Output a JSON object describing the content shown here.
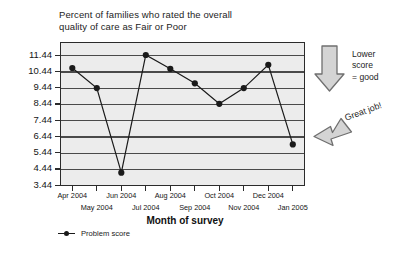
{
  "chart_data": {
    "type": "line",
    "title": "Percent of families who rated the overall quality of care as Fair or Poor",
    "title_line1": "Percent of families who rated the overall",
    "title_line2": "quality of care as Fair or Poor",
    "xlabel": "Month of survey",
    "ylabel": "",
    "categories": [
      "Apr 2004",
      "May 2004",
      "Jun 2004",
      "Jul 2004",
      "Aug 2004",
      "Sep 2004",
      "Oct 2004",
      "Nov 2004",
      "Dec 2004",
      "Jan 2005"
    ],
    "values": [
      10.64,
      9.4,
      4.2,
      11.44,
      10.59,
      9.7,
      8.44,
      9.4,
      10.84,
      5.94
    ],
    "series": [
      {
        "name": "Problem score",
        "values": [
          10.64,
          9.4,
          4.2,
          11.44,
          10.59,
          9.7,
          8.44,
          9.4,
          10.84,
          5.94
        ]
      }
    ],
    "ylim": [
      3.44,
      11.44
    ],
    "ytick_labels": [
      "11.44",
      "10.44",
      "9.44",
      "8.44",
      "7.44",
      "6.44",
      "5.44",
      "4.44",
      "3.44"
    ],
    "ytick_values": [
      11.44,
      10.44,
      9.44,
      8.44,
      7.44,
      6.44,
      5.44,
      4.44,
      3.44
    ],
    "grid": true,
    "legend_position": "below-left",
    "legend": [
      "Problem score"
    ],
    "annotations": [
      {
        "name": "lower-score-good",
        "text_lines": [
          "Lower",
          "score",
          "= good"
        ],
        "shape": "down-arrow"
      },
      {
        "name": "great-job",
        "text": "Great job!",
        "shape": "left-pointing-arrow",
        "points_to": "Jan 2005"
      }
    ],
    "colors": {
      "plot_background": "#ececec",
      "line": "#1a1a1a",
      "marker": "#1a1a1a",
      "gridline": "#4a4a4a",
      "frame": "#2b2b2b",
      "arrow_fill": "#d4d4d4",
      "arrow_stroke": "#6f6f6f"
    }
  },
  "legend": {
    "series_label": "Problem score"
  },
  "annotations": {
    "lower": "Lower",
    "score": "score",
    "good": "= good",
    "great_job": "Great job!"
  }
}
